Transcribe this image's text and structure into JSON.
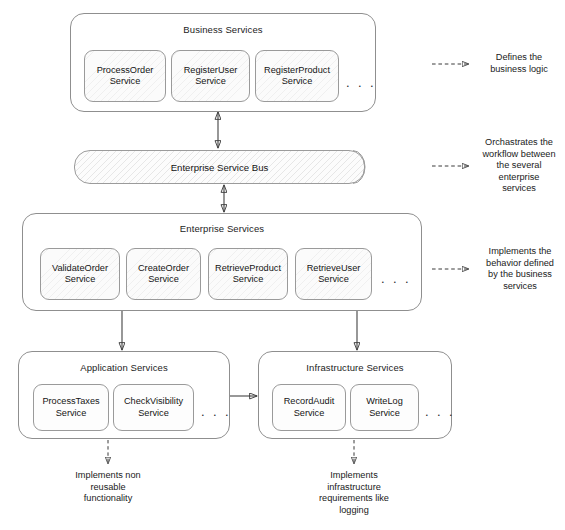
{
  "diagram": {
    "layers": [
      {
        "id": "business-services",
        "label": "Business Services",
        "services": [
          "ProcessOrder\nService",
          "RegisterUser\nService",
          "RegisterProduct\nService"
        ],
        "ellipsis": ". . ."
      },
      {
        "id": "enterprise-service-bus",
        "label": "Enterprise Service Bus"
      },
      {
        "id": "enterprise-services",
        "label": "Enterprise Services",
        "services": [
          "ValidateOrder\nService",
          "CreateOrder\nService",
          "RetrieveProduct\nService",
          "RetrieveUser\nService"
        ],
        "ellipsis": ". . ."
      },
      {
        "id": "application-services",
        "label": "Application Services",
        "services": [
          "ProcessTaxes\nService",
          "CheckVisibility\nService"
        ],
        "ellipsis": ". . ."
      },
      {
        "id": "infrastructure-services",
        "label": "Infrastructure Services",
        "services": [
          "RecordAudit\nService",
          "WriteLog\nService"
        ],
        "ellipsis": ". . ."
      }
    ],
    "services": {
      "business": [
        {
          "line1": "ProcessOrder",
          "line2": "Service"
        },
        {
          "line1": "RegisterUser",
          "line2": "Service"
        },
        {
          "line1": "RegisterProduct",
          "line2": "Service"
        }
      ],
      "enterprise": [
        {
          "line1": "ValidateOrder",
          "line2": "Service"
        },
        {
          "line1": "CreateOrder",
          "line2": "Service"
        },
        {
          "line1": "RetrieveProduct",
          "line2": "Service"
        },
        {
          "line1": "RetrieveUser",
          "line2": "Service"
        }
      ],
      "application": [
        {
          "line1": "ProcessTaxes",
          "line2": "Service"
        },
        {
          "line1": "CheckVisibility",
          "line2": "Service"
        }
      ],
      "infrastructure": [
        {
          "line1": "RecordAudit",
          "line2": "Service"
        },
        {
          "line1": "WriteLog",
          "line2": "Service"
        }
      ]
    },
    "ellipsis": ". . .",
    "annotations": [
      {
        "id": "note-business",
        "lines": [
          "Defines the",
          "business logic"
        ],
        "text": "Defines the business logic",
        "connector": "dashed-arrow-right"
      },
      {
        "id": "note-esb",
        "lines": [
          "Orchastrates the",
          "workflow between",
          "the several",
          "enterprise",
          "services"
        ],
        "text": "Orchastrates the workflow between the several enterprise services",
        "connector": "dashed-arrow-right"
      },
      {
        "id": "note-enterprise",
        "lines": [
          "Implements the",
          "behavior defined",
          "by the business",
          "services"
        ],
        "text": "Implements the behavior defined by the business services",
        "connector": "dashed-arrow-right"
      },
      {
        "id": "note-application",
        "lines": [
          "Implements non",
          "reusable",
          "functionality"
        ],
        "text": "Implements non reusable functionality",
        "connector": "dashed-arrow-down"
      },
      {
        "id": "note-infrastructure",
        "lines": [
          "Implements",
          "infrastructure",
          "requirements like",
          "logging"
        ],
        "text": "Implements infrastructure requirements like logging",
        "connector": "dashed-arrow-down"
      }
    ],
    "connectors": [
      {
        "id": "business-to-esb",
        "style": "solid",
        "heads": "both"
      },
      {
        "id": "esb-to-enterprise",
        "style": "solid",
        "heads": "both"
      },
      {
        "id": "enterprise-to-application",
        "style": "solid",
        "heads": "end"
      },
      {
        "id": "enterprise-to-infrastructure",
        "style": "solid",
        "heads": "end"
      },
      {
        "id": "application-to-infrastructure",
        "style": "solid",
        "heads": "end"
      }
    ],
    "colors": {
      "stroke": "#8f8f8f",
      "arrow": "#3a3a3a",
      "text": "#141414",
      "background": "#ffffff",
      "service_fill": "#fbfbfb"
    }
  }
}
